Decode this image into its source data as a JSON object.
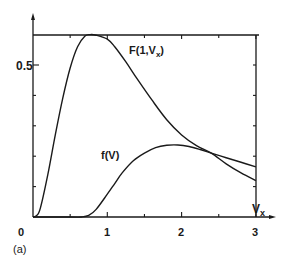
{
  "panel_label": "(a)",
  "colors": {
    "ink": "#1a1a1a",
    "background": "#ffffff"
  },
  "chart_data": {
    "type": "line",
    "title": "",
    "xlabel": "Vx",
    "ylabel": "",
    "xlim": [
      0,
      3.1
    ],
    "ylim": [
      0,
      0.65
    ],
    "x_ticks": [
      0,
      0.5,
      1,
      1.5,
      2,
      2.5,
      3
    ],
    "x_tick_labels": [
      "0",
      "1",
      "2",
      "3"
    ],
    "y_ticks": [
      0.1,
      0.2,
      0.3,
      0.4,
      0.5,
      0.6
    ],
    "y_tick_labels": [
      "0.5"
    ],
    "grid": false,
    "box_top": 0.6,
    "box_right": 3,
    "series": [
      {
        "name": "F(1,Vx)",
        "label_base": "F(1,V",
        "label_sub": "x",
        "label_close": ")",
        "x": [
          0,
          0.05,
          0.1,
          0.2,
          0.3,
          0.4,
          0.5,
          0.6,
          0.7,
          0.77,
          0.85,
          1.0,
          1.1,
          1.25,
          1.4,
          1.6,
          1.8,
          2.0,
          2.2,
          2.4,
          2.6,
          2.8,
          3.0
        ],
        "values": [
          0,
          0.005,
          0.03,
          0.14,
          0.27,
          0.39,
          0.49,
          0.56,
          0.595,
          0.6,
          0.598,
          0.585,
          0.56,
          0.51,
          0.455,
          0.385,
          0.32,
          0.27,
          0.235,
          0.21,
          0.175,
          0.145,
          0.12
        ]
      },
      {
        "name": "f(V)",
        "label": "f(V)",
        "x": [
          0,
          0.5,
          0.65,
          0.75,
          0.85,
          1.0,
          1.1,
          1.2,
          1.35,
          1.5,
          1.65,
          1.8,
          1.95,
          2.1,
          2.25,
          2.4,
          2.6,
          2.8,
          3.0
        ],
        "values": [
          0,
          0,
          0,
          0.005,
          0.025,
          0.075,
          0.11,
          0.145,
          0.185,
          0.21,
          0.228,
          0.236,
          0.237,
          0.232,
          0.222,
          0.21,
          0.195,
          0.18,
          0.165
        ]
      }
    ],
    "annotations": [
      "(a)"
    ]
  }
}
